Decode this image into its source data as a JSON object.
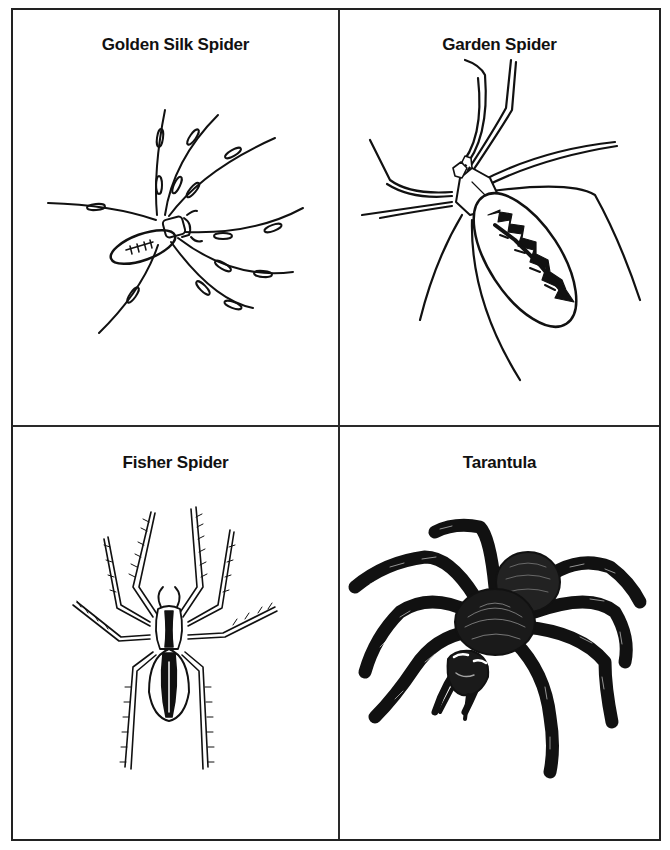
{
  "worksheet": {
    "panels": [
      {
        "title": "Golden Silk Spider",
        "illustration": "golden-silk-spider-drawing"
      },
      {
        "title": "Garden Spider",
        "illustration": "garden-spider-drawing"
      },
      {
        "title": "Fisher Spider",
        "illustration": "fisher-spider-drawing"
      },
      {
        "title": "Tarantula",
        "illustration": "tarantula-drawing"
      }
    ],
    "colors": {
      "line": "#111111",
      "background": "#ffffff",
      "border": "#222222"
    }
  }
}
